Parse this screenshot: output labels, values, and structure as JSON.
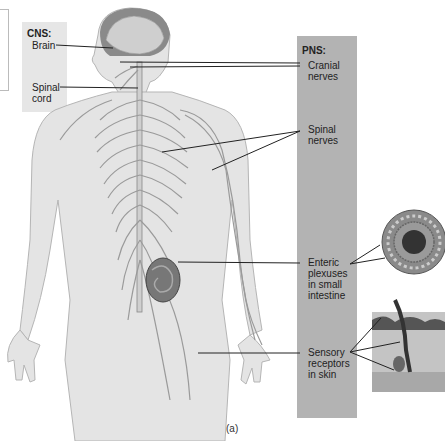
{
  "figure": {
    "caption": "(a)"
  },
  "cns": {
    "heading": "CNS:",
    "labels": [
      {
        "line1": "Brain",
        "line2": ""
      },
      {
        "line1": "Spinal",
        "line2": "cord"
      }
    ]
  },
  "pns": {
    "heading": "PNS:",
    "labels": [
      {
        "line1": "Cranial",
        "line2": "nerves",
        "line3": "",
        "line4": ""
      },
      {
        "line1": "Spinal",
        "line2": "nerves",
        "line3": "",
        "line4": ""
      },
      {
        "line1": "Enteric",
        "line2": "plexuses",
        "line3": "in small",
        "line4": "intestine"
      },
      {
        "line1": "Sensory",
        "line2": "receptors",
        "line3": "in skin",
        "line4": ""
      }
    ]
  },
  "colors": {
    "cns_panel": "#e6e6e6",
    "pns_panel": "#b3b3b3",
    "leader_line": "#222222",
    "body_fill": "#e2e2e2",
    "nerve": "#9a9a9a"
  }
}
